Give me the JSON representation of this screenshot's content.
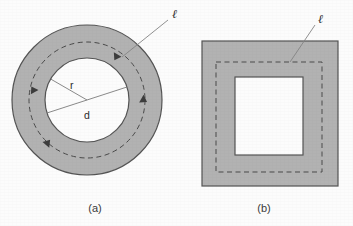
{
  "figure": {
    "background_color": "#fcfcfc",
    "shaded_fill": "#b2b2b2",
    "outline_color": "#545454",
    "dashed_color": "#4a4a4a",
    "leader_color": "#777777",
    "text_color": "#2b2b2b",
    "panels": [
      {
        "id": "a",
        "caption": "(a)",
        "shape": "annulus",
        "labels": {
          "path_symbol": "ℓ",
          "radius": "r",
          "diameter": "d"
        },
        "geometry": {
          "center_x": 87,
          "center_y": 100,
          "outer_radius": 75,
          "inner_radius": 42,
          "dashed_radius": 58,
          "leader_from_x": 168,
          "leader_from_y": 20,
          "leader_to_x": 122,
          "leader_to_y": 57,
          "ell_label_x": 172,
          "ell_label_y": 14
        }
      },
      {
        "id": "b",
        "caption": "(b)",
        "shape": "square-annulus",
        "labels": {
          "path_symbol": "ℓ"
        },
        "geometry": {
          "outer_x": 202,
          "outer_y": 41,
          "outer_w": 136,
          "outer_h": 145,
          "dashed_x": 216,
          "dashed_y": 62,
          "dashed_w": 106,
          "dashed_h": 110,
          "inner_x": 235,
          "inner_y": 77,
          "inner_w": 68,
          "inner_h": 78,
          "leader_from_x": 315,
          "leader_from_y": 25,
          "leader_to_x": 290,
          "leader_to_y": 62,
          "ell_label_x": 318,
          "ell_label_y": 19
        }
      }
    ],
    "caption_a_x": 95,
    "caption_a_y": 212,
    "caption_b_x": 264,
    "caption_b_y": 212
  }
}
